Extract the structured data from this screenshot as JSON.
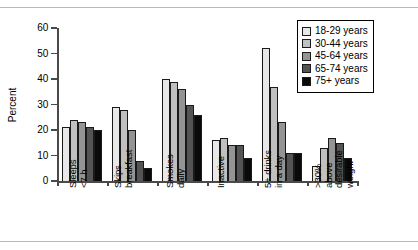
{
  "chart_data": {
    "type": "bar",
    "title": "",
    "xlabel": "",
    "ylabel": "Percent",
    "ylim": [
      0,
      60
    ],
    "yticks": [
      0,
      10,
      20,
      30,
      40,
      50,
      60
    ],
    "grid": false,
    "legend_position": "top-right",
    "categories": [
      "Sleeps\n<7 h",
      "Skips\nbreakfast",
      "Smokes\ndaily",
      "Inactive",
      "5+ drinks\nin a day",
      ">30%\nabove\ndesirable\nweight"
    ],
    "series": [
      {
        "name": "18-29 years",
        "color": "#e8e8e8",
        "values": [
          21,
          29,
          40,
          16,
          52,
          6
        ]
      },
      {
        "name": "30-44 years",
        "color": "#c0c0c0",
        "values": [
          24,
          28,
          39,
          17,
          37,
          13
        ]
      },
      {
        "name": "45-64 years",
        "color": "#949494",
        "values": [
          23,
          20,
          36,
          14,
          23,
          17
        ]
      },
      {
        "name": "65-74 years",
        "color": "#545454",
        "values": [
          21,
          8,
          30,
          14,
          11,
          15
        ]
      },
      {
        "name": "75+ years",
        "color": "#0a0a0a",
        "values": [
          20,
          5,
          26,
          9,
          11,
          9
        ]
      }
    ]
  },
  "legend": {
    "items": [
      {
        "label": "18-29 years"
      },
      {
        "label": "30-44 years"
      },
      {
        "label": "45-64 years"
      },
      {
        "label": "65-74 years"
      },
      {
        "label": "75+ years"
      }
    ]
  }
}
